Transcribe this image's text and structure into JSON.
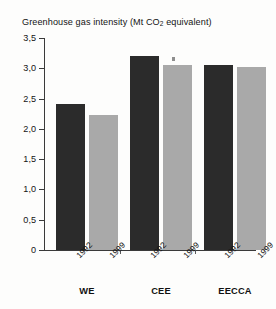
{
  "chart": {
    "title_main": "Greenhouse gas intensity (Mt CO",
    "title_sub": "2",
    "title_tail": " equivalent)",
    "title_full": "Greenhouse gas intensity (Mt CO2 equivalent)"
  },
  "axis": {
    "y_ticks": [
      "3,5",
      "3,0",
      "2,5",
      "2,0",
      "1,5",
      "1,0",
      "0,5",
      "0"
    ],
    "y_values": [
      3.5,
      3.0,
      2.5,
      2.0,
      1.5,
      1.0,
      0.5,
      0
    ]
  },
  "groups": [
    {
      "label": "WE"
    },
    {
      "label": "CEE"
    },
    {
      "label": "EECCA"
    }
  ],
  "bars": [
    {
      "group": "WE",
      "year": "1992",
      "value": 2.41,
      "color": "#2b2b2b"
    },
    {
      "group": "WE",
      "year": "1999",
      "value": 2.23,
      "color": "#a9a9a9"
    },
    {
      "group": "CEE",
      "year": "1992",
      "value": 3.2,
      "color": "#2b2b2b"
    },
    {
      "group": "CEE",
      "year": "1999",
      "value": 3.05,
      "color": "#a9a9a9"
    },
    {
      "group": "EECCA",
      "year": "1992",
      "value": 3.05,
      "color": "#2b2b2b"
    },
    {
      "group": "EECCA",
      "year": "1999",
      "value": 3.02,
      "color": "#a9a9a9"
    }
  ],
  "chart_data": {
    "type": "bar",
    "title": "Greenhouse gas intensity (Mt CO2 equivalent)",
    "xlabel": "",
    "ylabel": "",
    "ylim": [
      0,
      3.5
    ],
    "ytick_labels": [
      "0",
      "0,5",
      "1,0",
      "1,5",
      "2,0",
      "2,5",
      "3,0",
      "3,5"
    ],
    "ytick_values": [
      0,
      0.5,
      1.0,
      1.5,
      2.0,
      2.5,
      3.0,
      3.5
    ],
    "grid": false,
    "legend": "none",
    "categories": [
      "WE",
      "CEE",
      "EECCA"
    ],
    "series": [
      {
        "name": "1992",
        "values": [
          2.41,
          3.2,
          3.05
        ],
        "color": "#2b2b2b"
      },
      {
        "name": "1999",
        "values": [
          2.23,
          3.05,
          3.02
        ],
        "color": "#a9a9a9"
      }
    ],
    "x_tick_labels": [
      "1992",
      "1999",
      "1992",
      "1999",
      "1992",
      "1999"
    ],
    "annotations": []
  }
}
